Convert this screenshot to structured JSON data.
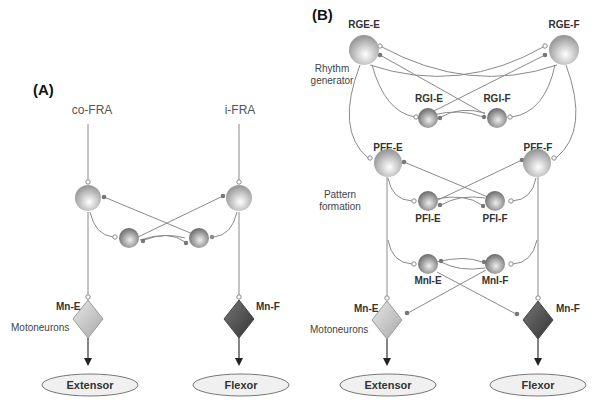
{
  "panels": {
    "a": {
      "label": "(A)",
      "inputs": {
        "left": "co-FRA",
        "right": "i-FRA"
      },
      "motoneurons": {
        "left": "Mn-E",
        "right": "Mn-F",
        "side_label": "Motoneurons"
      },
      "muscles": {
        "left": "Extensor",
        "right": "Flexor"
      }
    },
    "b": {
      "label": "(B)",
      "rhythm": {
        "left": "RGE-E",
        "right": "RGE-F",
        "inh_left": "RGI-E",
        "inh_right": "RGI-F",
        "side_label_1": "Rhythm",
        "side_label_2": "generator"
      },
      "pattern": {
        "left": "PFE-E",
        "right": "PFE-F",
        "inh_left": "PFI-E",
        "inh_right": "PFI-F",
        "side_label_1": "Pattern",
        "side_label_2": "formation"
      },
      "mn_inh": {
        "left": "MnI-E",
        "right": "MnI-F"
      },
      "motoneurons": {
        "left": "Mn-E",
        "right": "Mn-F",
        "side_label": "Motoneurons"
      },
      "muscles": {
        "left": "Extensor",
        "right": "Flexor"
      }
    }
  },
  "colors": {
    "excitatory_node": "#c8c8c8",
    "inhibitory_node": "#8e8e8e",
    "extensor_mn": "#d0d0d0",
    "flexor_mn": "#555555",
    "wire": "#8a8a8a"
  }
}
